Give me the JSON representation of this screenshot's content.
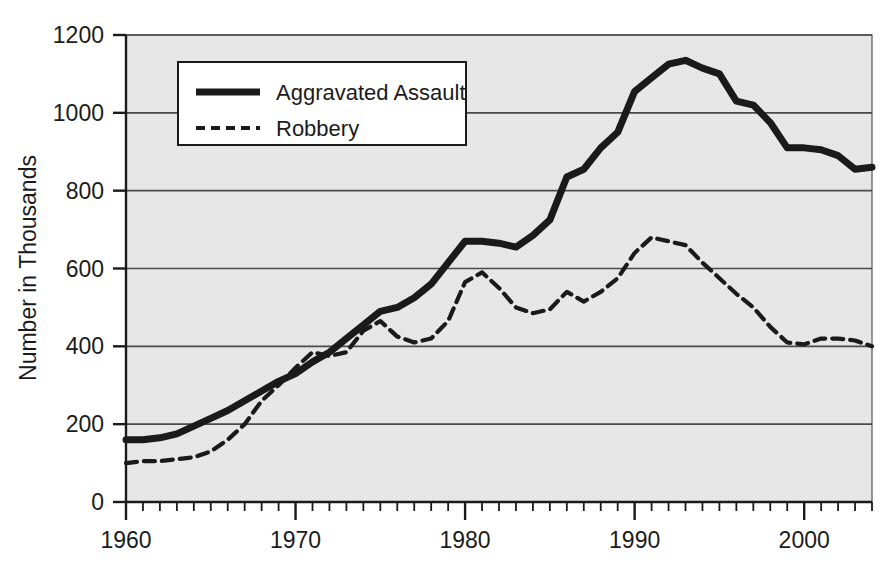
{
  "figure": {
    "title_clipped": "Aggravated Assault and Robbery",
    "background_color": "#ffffff",
    "plot_background_color": "#e6e6e6",
    "line_color": "#1a1a1a",
    "grid_color": "#4a4a4a"
  },
  "axes": {
    "y_axis_title": "Number in Thousands",
    "y_ticks": [
      "0",
      "200",
      "400",
      "600",
      "800",
      "1000",
      "1200"
    ],
    "x_ticks": [
      "1960",
      "1970",
      "1980",
      "1990",
      "2000"
    ]
  },
  "legend": {
    "items": [
      {
        "label": "Aggravated Assault",
        "style": "solid",
        "swatch": "legend-swatch-solid"
      },
      {
        "label": "Robbery",
        "style": "dashed",
        "swatch": "legend-swatch-dashed"
      }
    ]
  },
  "chart_data": {
    "type": "line",
    "title": "Aggravated Assault and Robbery",
    "xlabel": "",
    "ylabel": "Number in Thousands",
    "xlim": [
      1960,
      2004
    ],
    "ylim": [
      0,
      1200
    ],
    "grid": true,
    "grid_axis": "y",
    "legend_position": "upper-left-inside",
    "x": [
      1960,
      1961,
      1962,
      1963,
      1964,
      1965,
      1966,
      1967,
      1968,
      1969,
      1970,
      1971,
      1972,
      1973,
      1974,
      1975,
      1976,
      1977,
      1978,
      1979,
      1980,
      1981,
      1982,
      1983,
      1984,
      1985,
      1986,
      1987,
      1988,
      1989,
      1990,
      1991,
      1992,
      1993,
      1994,
      1995,
      1996,
      1997,
      1998,
      1999,
      2000,
      2001,
      2002,
      2003,
      2004
    ],
    "series": [
      {
        "name": "Aggravated Assault",
        "style": "solid",
        "values": [
          160,
          160,
          165,
          175,
          195,
          215,
          235,
          260,
          285,
          310,
          330,
          360,
          385,
          420,
          455,
          490,
          500,
          525,
          560,
          615,
          670,
          670,
          665,
          655,
          685,
          725,
          835,
          855,
          910,
          950,
          1055,
          1090,
          1125,
          1135,
          1115,
          1100,
          1030,
          1020,
          975,
          910,
          910,
          905,
          890,
          855,
          860
        ]
      },
      {
        "name": "Robbery",
        "style": "dashed",
        "values": [
          100,
          105,
          105,
          110,
          115,
          130,
          160,
          200,
          260,
          300,
          345,
          385,
          375,
          385,
          440,
          465,
          425,
          410,
          420,
          465,
          565,
          590,
          550,
          500,
          485,
          495,
          540,
          515,
          540,
          575,
          640,
          680,
          670,
          660,
          615,
          575,
          535,
          500,
          450,
          410,
          405,
          420,
          420,
          415,
          400
        ]
      }
    ]
  }
}
